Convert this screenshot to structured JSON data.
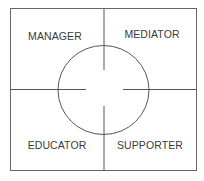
{
  "diagram": {
    "type": "quadrant-role-diagram",
    "quadrants": {
      "top_left": {
        "label": "MANAGER"
      },
      "top_right": {
        "label": "MEDIATOR"
      },
      "bottom_left": {
        "label": "EDUCATOR"
      },
      "bottom_right": {
        "label": "SUPPORTER"
      }
    },
    "center_shape": "circle",
    "colors": {
      "line": "#555555",
      "text": "#3a3a3a",
      "background": "#ffffff"
    }
  }
}
